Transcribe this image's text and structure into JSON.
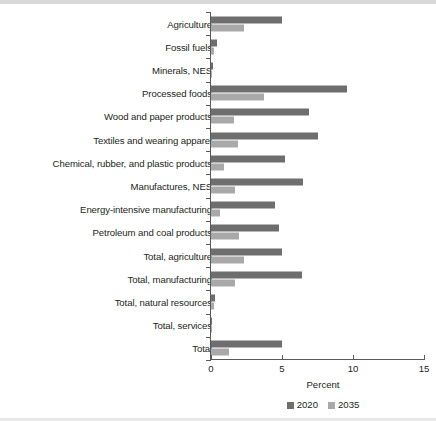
{
  "chart_data": {
    "type": "bar",
    "orientation": "horizontal",
    "title": "",
    "xlabel": "Percent",
    "ylabel": "",
    "xlim": [
      0,
      15
    ],
    "xticks": [
      "0",
      "5",
      "10",
      "15"
    ],
    "xtick_values": [
      0,
      5,
      10,
      15
    ],
    "grid": false,
    "legend_position": "bottom",
    "categories": [
      "Agriculture",
      "Fossil fuels",
      "Minerals, NES",
      "Processed foods",
      "Wood and paper products",
      "Textiles and wearing apparel",
      "Chemical, rubber, and plastic products",
      "Manufactures, NES",
      "Energy-intensive manufacturing",
      "Petroleum and coal products",
      "Total, agriculture",
      "Total, manufacturing",
      "Total, natural resources",
      "Total, services",
      "Total"
    ],
    "series": [
      {
        "name": "2020",
        "color": "#6e6e6e",
        "values": [
          5.0,
          0.4,
          0.15,
          9.6,
          6.9,
          7.5,
          5.2,
          6.5,
          4.5,
          4.8,
          5.0,
          6.4,
          0.3,
          0.1,
          5.0
        ]
      },
      {
        "name": "2035",
        "color": "#a9a9a9",
        "values": [
          2.3,
          0.2,
          0.1,
          3.7,
          1.6,
          1.9,
          0.9,
          1.7,
          0.6,
          2.0,
          2.3,
          1.7,
          0.2,
          0.08,
          1.3
        ]
      }
    ]
  },
  "axis": {
    "x_title": "Percent"
  },
  "legend": {
    "items": [
      {
        "label": "2020",
        "color": "#6e6e6e"
      },
      {
        "label": "2035",
        "color": "#a9a9a9"
      }
    ]
  }
}
